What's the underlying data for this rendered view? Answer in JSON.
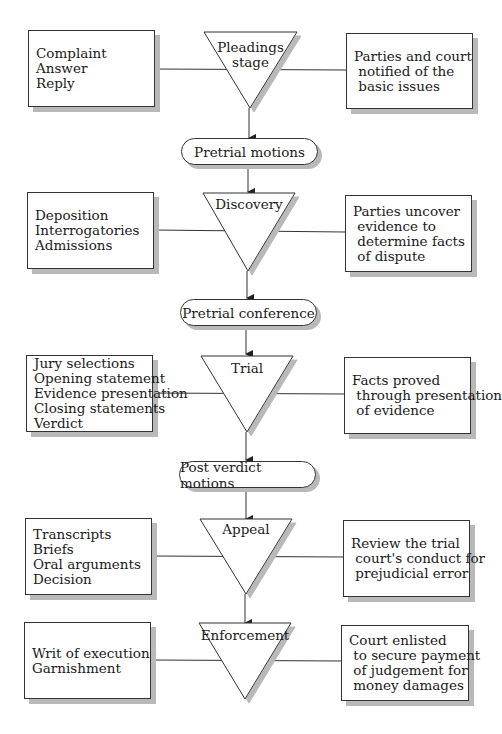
{
  "stages": [
    {
      "name": "Pleadings stage",
      "label": "Pleadings\nstage",
      "left": "Complaint\nAnswer\nReply",
      "right": "Parties and court\n notified of the\n basic issues"
    },
    {
      "name": "Discovery",
      "label": "Discovery",
      "left": "Deposition\nInterrogatories\nAdmissions",
      "right": "Parties uncover\n evidence to\n determine facts\n of dispute"
    },
    {
      "name": "Trial",
      "label": "Trial",
      "left": "Jury selections\nOpening statement\nEvidence presentation\nClosing statements\nVerdict",
      "right": "Facts proved\n through presentation\n of evidence"
    },
    {
      "name": "Appeal",
      "label": "Appeal",
      "left": "Transcripts\nBriefs\nOral arguments\nDecision",
      "right": "Review the trial\n court's conduct for\n prejudicial error"
    },
    {
      "name": "Enforcement",
      "label": "Enforcement",
      "left": "Writ of execution\nGarnishment",
      "right": "Court enlisted\n to secure payment\n of judgement for\n money damages"
    }
  ],
  "transitions": [
    {
      "label": "Pretrial motions"
    },
    {
      "label": "Pretrial conference"
    },
    {
      "label": "Post verdict motions"
    }
  ],
  "colors": {
    "line": "#333333",
    "shadow": "#b9b9b9",
    "background": "#ffffff"
  }
}
